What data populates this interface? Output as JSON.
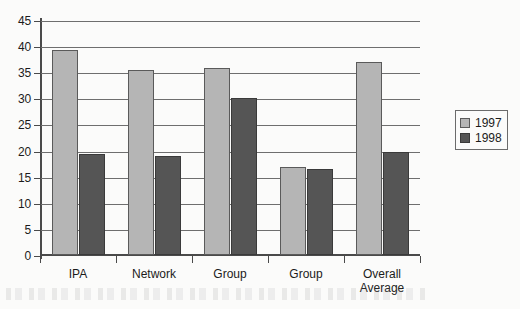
{
  "chart_data": {
    "type": "bar",
    "title": "",
    "subtitle": "",
    "xlabel": "",
    "ylabel": "",
    "ylim": [
      0,
      45
    ],
    "ytick_step": 5,
    "yticks": [
      0,
      5,
      10,
      15,
      20,
      25,
      30,
      35,
      40,
      45
    ],
    "ytick_labels": [
      "0",
      "5",
      "10",
      "15",
      "20",
      "25",
      "30",
      "35",
      "40",
      "45"
    ],
    "grid": true,
    "grid_axis": "y",
    "legend_position": "right",
    "categories": [
      "IPA",
      "Network",
      "Group",
      "Group",
      "Overall\nAverage"
    ],
    "series": [
      {
        "name": "1997",
        "color": "#b5b5b5",
        "values": [
          39.2,
          35.5,
          35.8,
          16.8,
          37.0
        ]
      },
      {
        "name": "1998",
        "color": "#555555",
        "values": [
          19.3,
          19.0,
          30.0,
          16.4,
          19.8
        ]
      }
    ],
    "annotations": []
  },
  "legend": {
    "entries": [
      {
        "label": "1997",
        "swatch": "swatch-1997"
      },
      {
        "label": "1998",
        "swatch": "swatch-1998"
      }
    ]
  },
  "colors": {
    "series_1997": "#b5b5b5",
    "series_1998": "#555555",
    "axis": "#4a4a4a",
    "gridline": "#6e6e6e",
    "text": "#1b1b1b",
    "background": "#fbfbfa"
  }
}
